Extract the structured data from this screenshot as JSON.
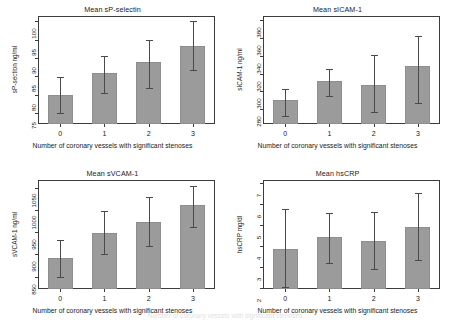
{
  "figure": {
    "xlabel": "Number of coronary vessels with significant stenoses",
    "xticks": [
      "0",
      "1",
      "2",
      "3"
    ],
    "bar_color": "#9b9b9b",
    "error_color": "#4a4a4a",
    "axis_color": "#3c3c3c"
  },
  "artifact": {
    "line1": "Number of coronary vessels with significant stenoses",
    "line2": ""
  },
  "chart_data": [
    {
      "type": "bar",
      "title": "Mean sP-selectin",
      "xlabel": "Number of coronary vessels with significant stenoses",
      "ylabel": "sP-section ng/ml",
      "categories": [
        "0",
        "1",
        "2",
        "3"
      ],
      "values": [
        79.8,
        85.8,
        88.8,
        93.2
      ],
      "err_low": [
        74.9,
        80.6,
        81.7,
        86.8
      ],
      "err_high": [
        84.8,
        90.6,
        95.0,
        100.0
      ],
      "yticks": [
        75,
        80,
        85,
        90,
        95,
        100
      ],
      "ylim": [
        72.0,
        101.5
      ],
      "grid": false,
      "legend": "none"
    },
    {
      "type": "bar",
      "title": "Mean sICAM-1",
      "xlabel": "Number of coronary vessels with significant stenoses",
      "ylabel": "sICAM-1 ng/ml",
      "categories": [
        "0",
        "1",
        "2",
        "3"
      ],
      "values": [
        290,
        312,
        307,
        328
      ],
      "err_low": [
        272,
        295,
        277,
        287
      ],
      "err_high": [
        303,
        325,
        341,
        362
      ],
      "yticks": [
        280,
        300,
        320,
        340,
        360,
        380
      ],
      "ylim": [
        263,
        385
      ],
      "grid": false,
      "legend": "none"
    },
    {
      "type": "bar",
      "title": "Mean sVCAM-1",
      "xlabel": "Number of coronary vessels with significant stenoses",
      "ylabel": "sVCAM-1 ng/ml",
      "categories": [
        "0",
        "1",
        "2",
        "3"
      ],
      "values": [
        892,
        949,
        974,
        1012
      ],
      "err_low": [
        850,
        901,
        918,
        961
      ],
      "err_high": [
        932,
        999,
        1030,
        1055
      ],
      "yticks": [
        850,
        900,
        950,
        1000,
        1050
      ],
      "ylim": [
        822,
        1068
      ],
      "grid": false,
      "legend": "none"
    },
    {
      "type": "bar",
      "title": "Mean hsCRP",
      "xlabel": "Number of coronary vessels with significant stenoses",
      "ylabel": "hsCRP mg/dl",
      "categories": [
        "0",
        "1",
        "2",
        "3"
      ],
      "values": [
        3.88,
        4.45,
        4.26,
        4.93
      ],
      "err_low": [
        2.03,
        3.21,
        2.92,
        3.31
      ],
      "err_high": [
        5.75,
        5.56,
        5.62,
        6.53
      ],
      "yticks": [
        2,
        3,
        4,
        5,
        6,
        7
      ],
      "ylim": [
        1.95,
        7.15
      ],
      "grid": false,
      "legend": "none"
    }
  ]
}
